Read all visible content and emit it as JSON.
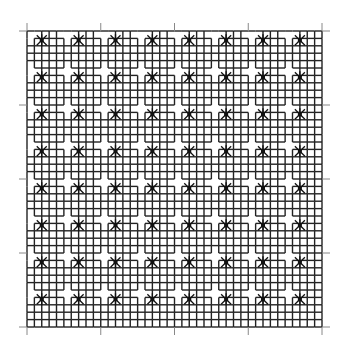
{
  "figure": {
    "background": "#ffffff",
    "line_color": "#222222",
    "tick_color": "#888888",
    "grid": {
      "left": 27,
      "top": 31,
      "right": 322,
      "bottom": 327,
      "star_columns": 8,
      "star_rows": 8,
      "star_spacing": 37,
      "tick_spacing": 74,
      "tick_count": 5
    }
  }
}
